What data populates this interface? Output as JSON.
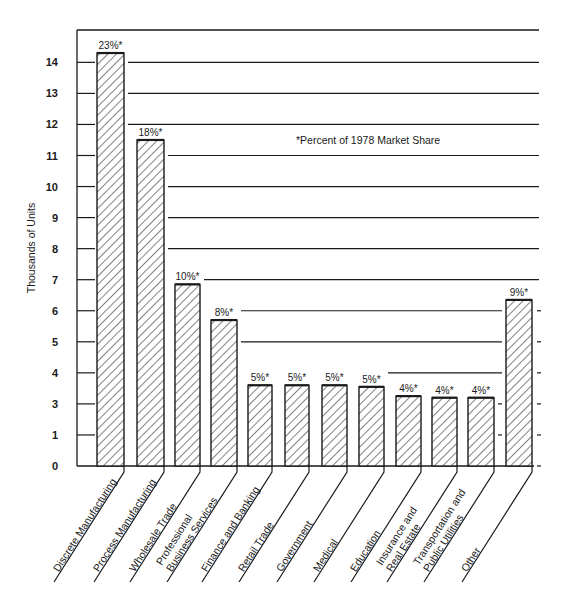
{
  "chart_data": {
    "type": "bar",
    "title": "",
    "xlabel": "",
    "ylabel": "Thousands of Units",
    "annotation": "*Percent of 1978 Market Share",
    "yticks": [
      {
        "label": "14",
        "pos": 14
      },
      {
        "label": "13",
        "pos": 13
      },
      {
        "label": "12",
        "pos": 12
      },
      {
        "label": "11",
        "pos": 11
      },
      {
        "label": "10",
        "pos": 10
      },
      {
        "label": "9",
        "pos": 9
      },
      {
        "label": "8",
        "pos": 8
      },
      {
        "label": "7",
        "pos": 7
      },
      {
        "label": "6",
        "pos": 6
      },
      {
        "label": "5",
        "pos": 5
      },
      {
        "label": "4",
        "pos": 4
      },
      {
        "label": "3",
        "pos": 3
      },
      {
        "label": "1",
        "pos": 1
      },
      {
        "label": "0",
        "pos": 0
      }
    ],
    "ylim": [
      0,
      15
    ],
    "grid": true,
    "legend": null,
    "categories": [
      "Discrete Manufacturing",
      "Process Manufacturing",
      "Wholesale Trade",
      "Professional Business Services",
      "Finance and Banking",
      "Retail Trade",
      "Government",
      "Medical",
      "Education",
      "Insurance and Real Estate",
      "Transportation and Public Utilities",
      "Other"
    ],
    "category_lines": [
      [
        "Discrete Manufacturing"
      ],
      [
        "Process Manufacturing"
      ],
      [
        "Wholesale Trade"
      ],
      [
        "Professional",
        "Business Services"
      ],
      [
        "Finance and Banking"
      ],
      [
        "Retail Trade"
      ],
      [
        "Government"
      ],
      [
        "Medical"
      ],
      [
        "Education"
      ],
      [
        "Insurance and",
        "Real Estate"
      ],
      [
        "Transportation and",
        "Public Utilities"
      ],
      [
        "Other"
      ]
    ],
    "values": [
      14.3,
      11.5,
      6.85,
      5.7,
      3.6,
      3.6,
      3.6,
      3.55,
      3.25,
      3.2,
      3.2,
      6.35
    ],
    "percent_labels": [
      "23%*",
      "18%*",
      "10%*",
      "8%*",
      "5%*",
      "5%*",
      "5%*",
      "5%*",
      "4%*",
      "4%*",
      "4%*",
      "9%*"
    ],
    "series": [
      {
        "name": "Thousands of Units",
        "values": [
          14.3,
          11.5,
          6.85,
          5.7,
          3.6,
          3.6,
          3.6,
          3.55,
          3.25,
          3.2,
          3.2,
          6.35
        ]
      }
    ]
  },
  "style": {
    "ink": "#1a1a1a",
    "background": "#ffffff",
    "bar_fill": "#ffffff",
    "hatch": "#1a1a1a"
  }
}
